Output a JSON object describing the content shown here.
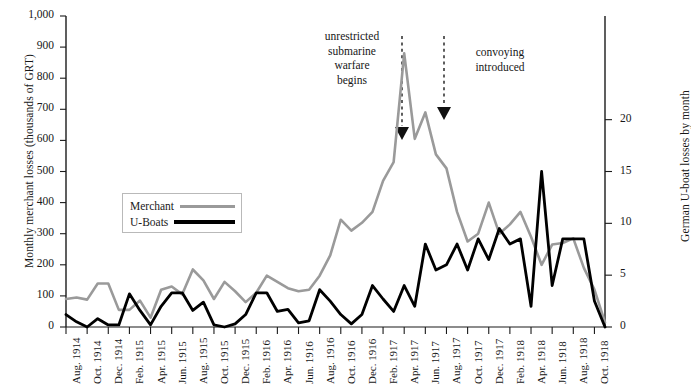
{
  "axes": {
    "left_title": "Monthly merchant losses (thousands of GRT)",
    "right_title": "German U-boat losses by month",
    "left_ticks": [
      "1,000",
      "900",
      "800",
      "700",
      "600",
      "500",
      "400",
      "300",
      "200",
      "100",
      "0"
    ],
    "right_ticks": [
      "20",
      "15",
      "10",
      "5",
      "0"
    ]
  },
  "legend": {
    "merchant_label": "Merchant",
    "uboat_label": "U-Boats",
    "merchant_color": "#9a9a9a",
    "uboat_color": "#000000"
  },
  "annotations": {
    "unrestricted": "unrestricted\nsubmarine\nwarfare\nbegins",
    "convoying": "convoying\nintroduced"
  },
  "chart_data": {
    "type": "line",
    "title": "",
    "xlabel": "",
    "ylabel": "Monthly merchant losses (thousands of GRT)",
    "y2label": "German U-boat losses by month",
    "ylim": [
      0,
      1000
    ],
    "y2lim": [
      0,
      30
    ],
    "grid": false,
    "legend_position": "inside-left",
    "xtick_labels": [
      "Aug. 1914",
      "Oct. 1914",
      "Dec. 1914",
      "Feb. 1915",
      "Apr. 1915",
      "Jun. 1915",
      "Aug. 1915",
      "Oct. 1915",
      "Dec. 1915",
      "Feb. 1916",
      "Apr. 1916",
      "Jun. 1916",
      "Aug. 1916",
      "Oct. 1916",
      "Dec. 1916",
      "Feb. 1917",
      "Apr. 1917",
      "Jun. 1917",
      "Aug. 1917",
      "Oct. 1917",
      "Dec. 1917",
      "Feb. 1918",
      "Apr. 1918",
      "Jun. 1918",
      "Aug. 1918",
      "Oct. 1918"
    ],
    "x": [
      "Aug. 1914",
      "Sep. 1914",
      "Oct. 1914",
      "Nov. 1914",
      "Dec. 1914",
      "Jan. 1915",
      "Feb. 1915",
      "Mar. 1915",
      "Apr. 1915",
      "May 1915",
      "Jun. 1915",
      "Jul. 1915",
      "Aug. 1915",
      "Sep. 1915",
      "Oct. 1915",
      "Nov. 1915",
      "Dec. 1915",
      "Jan. 1916",
      "Feb. 1916",
      "Mar. 1916",
      "Apr. 1916",
      "May 1916",
      "Jun. 1916",
      "Jul. 1916",
      "Aug. 1916",
      "Sep. 1916",
      "Oct. 1916",
      "Nov. 1916",
      "Dec. 1916",
      "Jan. 1917",
      "Feb. 1917",
      "Mar. 1917",
      "Apr. 1917",
      "May 1917",
      "Jun. 1917",
      "Jul. 1917",
      "Aug. 1917",
      "Sep. 1917",
      "Oct. 1917",
      "Nov. 1917",
      "Dec. 1917",
      "Jan. 1918",
      "Feb. 1918",
      "Mar. 1918",
      "Apr. 1918",
      "May 1918",
      "Jun. 1918",
      "Jul. 1918",
      "Aug. 1918",
      "Sep. 1918",
      "Oct. 1918",
      "Nov. 1918"
    ],
    "series": [
      {
        "name": "Merchant",
        "axis": "left",
        "units": "thousands of GRT",
        "color": "#9a9a9a",
        "values": [
          90,
          95,
          88,
          140,
          140,
          55,
          55,
          85,
          30,
          120,
          130,
          105,
          185,
          150,
          90,
          145,
          115,
          80,
          110,
          165,
          145,
          125,
          115,
          120,
          165,
          230,
          345,
          310,
          335,
          370,
          470,
          530,
          880,
          605,
          690,
          555,
          510,
          370,
          275,
          300,
          400,
          300,
          330,
          370,
          290,
          200,
          265,
          270,
          285,
          190,
          120,
          15
        ]
      },
      {
        "name": "U-Boats",
        "axis": "right",
        "units": "U-boats lost",
        "color": "#000000",
        "values": [
          1.2,
          0.5,
          0,
          0.8,
          0.2,
          0.2,
          3.2,
          1.6,
          0.2,
          2.0,
          3.3,
          3.3,
          1.6,
          2.4,
          0.2,
          0,
          0.3,
          1.2,
          3.3,
          3.3,
          1.5,
          1.7,
          0.4,
          0.6,
          3.6,
          2.5,
          1.2,
          0.3,
          1.2,
          4.0,
          2.7,
          1.5,
          4.0,
          2.0,
          8.0,
          5.5,
          6.0,
          8.0,
          5.5,
          8.5,
          6.5,
          9.5,
          8.0,
          8.5,
          2.0,
          15.0,
          4.0,
          8.5,
          8.5,
          8.5,
          2.5,
          0
        ]
      }
    ],
    "annotations": [
      {
        "text": "unrestricted submarine warfare begins",
        "points_to": "Feb. 1917",
        "style": "dashed-arrow"
      },
      {
        "text": "convoying introduced",
        "points_to": "May 1917",
        "style": "dashed-arrow"
      }
    ]
  }
}
